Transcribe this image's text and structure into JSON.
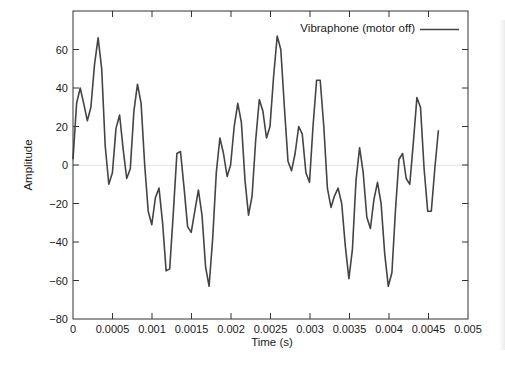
{
  "chart_data": {
    "type": "line",
    "title": "",
    "xlabel": "Time (s)",
    "ylabel": "Amplitude",
    "xlim": [
      0,
      0.005
    ],
    "ylim": [
      -80,
      80
    ],
    "xticks": [
      0,
      0.0005,
      0.001,
      0.0015,
      0.002,
      0.0025,
      0.003,
      0.0035,
      0.004,
      0.0045,
      0.005
    ],
    "xtick_labels": [
      "0",
      "0.0005",
      "0.001",
      "0.0015",
      "0.002",
      "0.0025",
      "0.003",
      "0.0035",
      "0.004",
      "0.0045",
      "0.005"
    ],
    "yticks": [
      -80,
      -60,
      -40,
      -20,
      0,
      20,
      40,
      60
    ],
    "ytick_labels": [
      "-80",
      "-60",
      "-40",
      "-20",
      "0",
      "20",
      "40",
      "60"
    ],
    "grid": false,
    "zero_line": true,
    "legend_position": "upper right",
    "sample_interval": 4.535e-05,
    "series": [
      {
        "name": "Vibraphone (motor off)",
        "color": "#444444",
        "values": [
          3,
          32,
          40,
          32,
          23,
          30,
          52,
          66,
          50,
          10,
          -10,
          -4,
          19,
          26,
          8,
          -7,
          -2,
          28,
          42,
          32,
          0,
          -24,
          -31,
          -17,
          -12,
          -30,
          -55,
          -54,
          -25,
          6,
          7,
          -12,
          -32,
          -35,
          -24,
          -13,
          -26,
          -53,
          -63,
          -38,
          -4,
          14,
          6,
          -6,
          0,
          20,
          32,
          22,
          -8,
          -26,
          -16,
          13,
          34,
          28,
          14,
          20,
          46,
          67,
          60,
          30,
          2,
          -3,
          6,
          20,
          16,
          -4,
          -9,
          20,
          44,
          44,
          20,
          -12,
          -22,
          -16,
          -12,
          -20,
          -42,
          -59,
          -44,
          -8,
          9,
          -4,
          -27,
          -33,
          -18,
          -9,
          -20,
          -46,
          -63,
          -56,
          -24,
          3,
          6,
          -7,
          -10,
          12,
          35,
          30,
          -2,
          -24,
          -24,
          -2,
          18
        ]
      }
    ]
  },
  "legend": {
    "label": "Vibraphone (motor off)"
  },
  "axes": {
    "xlabel": "Time (s)",
    "ylabel": "Amplitude"
  }
}
